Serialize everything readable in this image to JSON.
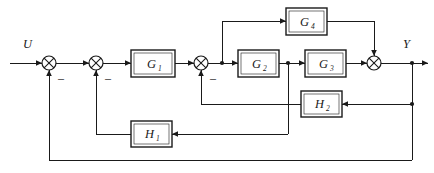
{
  "diagram": {
    "type": "control-system-block-diagram",
    "title": "",
    "input_label": "U",
    "output_label": "Y",
    "blocks": [
      {
        "id": "g1",
        "base": "G",
        "sub": "1",
        "label": "G1",
        "x": 131,
        "y": 50,
        "w": 44,
        "h": 27
      },
      {
        "id": "g2",
        "base": "G",
        "sub": "2",
        "label": "G2",
        "x": 238,
        "y": 50,
        "w": 41,
        "h": 27
      },
      {
        "id": "g3",
        "base": "G",
        "sub": "3",
        "label": "G3",
        "x": 305,
        "y": 50,
        "w": 41,
        "h": 27
      },
      {
        "id": "g4",
        "base": "G",
        "sub": "4",
        "label": "G4",
        "x": 286,
        "y": 8,
        "w": 41,
        "h": 27
      },
      {
        "id": "h2",
        "base": "H",
        "sub": "2",
        "label": "H2",
        "x": 301,
        "y": 91,
        "w": 41,
        "h": 26
      },
      {
        "id": "h1",
        "base": "H",
        "sub": "1",
        "label": "H1",
        "x": 131,
        "y": 121,
        "w": 41,
        "h": 26
      }
    ],
    "summing_junctions": [
      {
        "id": "s1",
        "cx": 49,
        "cy": 63,
        "r": 7,
        "sign": "–",
        "sign_x": 61,
        "sign_y": 79
      },
      {
        "id": "s2",
        "cx": 96,
        "cy": 63,
        "r": 7,
        "sign": "–",
        "sign_y": 79,
        "sign_x": 108
      },
      {
        "id": "s3",
        "cx": 201,
        "cy": 63,
        "r": 7,
        "sign": "–",
        "sign_x": 213,
        "sign_y": 79
      },
      {
        "id": "s4",
        "cx": 374,
        "cy": 63,
        "r": 7,
        "sign": "",
        "sign_x": 0,
        "sign_y": 0
      }
    ],
    "nodes": [
      {
        "id": "tap-g4",
        "cx": 222,
        "cy": 63
      },
      {
        "id": "tap-h1",
        "cx": 288,
        "cy": 63
      },
      {
        "id": "tap-h2",
        "cx": 412,
        "cy": 63
      },
      {
        "id": "tap-outer",
        "cx": 412,
        "cy": 63
      }
    ],
    "signals": {
      "input": "U",
      "output": "Y",
      "minus": "–"
    },
    "connections": [
      "U -> s1",
      "s1 -> s2",
      "s2 -> G1",
      "G1 -> s3",
      "s3 -> tap-g4 -> G2",
      "tap-g4 -> G4 (up)",
      "G2 -> tap-h1 -> G3",
      "G3 -> s4",
      "G4 -> s4 (down)",
      "s4 -> Y",
      "Y -> H2 -> s3 (minus)",
      "tap-h1 -> H1 -> s2 (minus)",
      "Y -> s1 (minus, outer loop)"
    ]
  }
}
